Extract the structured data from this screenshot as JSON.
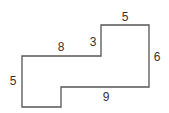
{
  "diagram": {
    "type": "rectilinear-polygon",
    "stroke_color": "#555555",
    "label_color": "#333333",
    "vertices": [
      [
        101,
        25
      ],
      [
        149,
        25
      ],
      [
        149,
        87
      ],
      [
        61,
        87
      ],
      [
        61,
        107
      ],
      [
        22,
        107
      ],
      [
        22,
        56
      ],
      [
        101,
        56
      ]
    ],
    "side_labels": {
      "top": "5",
      "step_vertical": "3",
      "upper_left_horizontal": "8",
      "right": "6",
      "left": "5",
      "bottom_step_horizontal": "9"
    }
  }
}
